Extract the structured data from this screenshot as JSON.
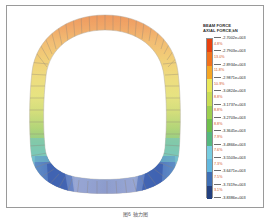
{
  "figure": {
    "caption": "图6  轴力图"
  },
  "legend": {
    "title": "BEAM FORCE\nAXIAL FORCE,kN",
    "percent_labels": [
      "4.8%",
      "13.0%",
      "11.8%",
      "10.9%",
      "8.8%",
      "8.8%",
      "8.8%",
      "7.9%",
      "7.6%",
      "7.3%",
      "7.5%",
      "3.1%"
    ],
    "ticks": [
      "-2.7002e+003",
      "-2.7903e+003",
      "-2.8934e+003",
      "-2.9871e+003",
      "-3.0824e+003",
      "-3.1737e+003",
      "-3.2703e+003",
      "-3.3645e+003",
      "-3.4866e+003",
      "-3.5503e+003",
      "-3.6471e+003",
      "-3.7419e+003",
      "-3.8386e+003"
    ],
    "colors": [
      "#e8420f",
      "#f2711c",
      "#f5a623",
      "#f0d13c",
      "#e9e85a",
      "#c9dd54",
      "#9ccf4f",
      "#6fbf4c",
      "#55b87f",
      "#63c0b4",
      "#77cde0",
      "#62b8de",
      "#4c94c9",
      "#3f6fb4",
      "#30539e",
      "#23407f"
    ]
  },
  "chart_data": {
    "type": "heatmap",
    "xlabel": "",
    "ylabel": "",
    "units": "kN",
    "value_min": -3838.6,
    "value_max": -2700.2,
    "bands": [
      {
        "upper": "-2.7002e+003",
        "lower": "-2.7903e+003",
        "percent": "4.8%",
        "color": "#e8420f"
      },
      {
        "upper": "-2.7903e+003",
        "lower": "-2.8934e+003",
        "percent": "13.0%",
        "color": "#f2711c"
      },
      {
        "upper": "-2.8934e+003",
        "lower": "-2.9871e+003",
        "percent": "11.8%",
        "color": "#f5a623"
      },
      {
        "upper": "-2.9871e+003",
        "lower": "-3.0824e+003",
        "percent": "10.9%",
        "color": "#e9e85a"
      },
      {
        "upper": "-3.0824e+003",
        "lower": "-3.1737e+003",
        "percent": "8.8%",
        "color": "#c9dd54"
      },
      {
        "upper": "-3.1737e+003",
        "lower": "-3.2703e+003",
        "percent": "8.8%",
        "color": "#9ccf4f"
      },
      {
        "upper": "-3.2703e+003",
        "lower": "-3.3645e+003",
        "percent": "8.8%",
        "color": "#6fbf4c"
      },
      {
        "upper": "-3.3645e+003",
        "lower": "-3.4866e+003",
        "percent": "7.9%",
        "color": "#55b87f"
      },
      {
        "upper": "-3.4866e+003",
        "lower": "-3.5503e+003",
        "percent": "7.6%",
        "color": "#77cde0"
      },
      {
        "upper": "-3.5503e+003",
        "lower": "-3.6471e+003",
        "percent": "7.3%",
        "color": "#62b8de"
      },
      {
        "upper": "-3.6471e+003",
        "lower": "-3.7419e+003",
        "percent": "7.5%",
        "color": "#3f6fb4"
      },
      {
        "upper": "-3.7419e+003",
        "lower": "-3.8386e+003",
        "percent": "3.1%",
        "color": "#23407f"
      }
    ],
    "geometry": "closed tunnel lining ring, segmented beam elements, axial force contour"
  }
}
